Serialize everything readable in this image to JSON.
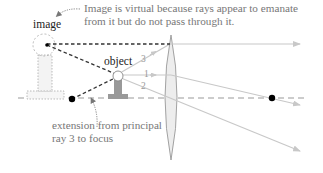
{
  "labels": {
    "image": "image",
    "object": "object",
    "note_line1": "Image is virtual because rays appear to emanate",
    "note_line2": "from it but do not pass through it.",
    "extension_line1": "extension from principal",
    "extension_line2": "ray 3 to focus",
    "ray1": "1",
    "ray2": "2",
    "ray3": "3"
  },
  "colors": {
    "ray": "#c8c8c8",
    "axis": "#999999",
    "dashed_extension": "#333333",
    "lens_fill": "#ededed",
    "lens_stroke": "#999999",
    "object_fill": "#999999",
    "image_outline": "#aaaaaa",
    "focal_point": "#000000",
    "text_note": "#777777",
    "text_label": "#222222"
  },
  "geometry": {
    "optical_axis_y": 98,
    "lens_center_x": 171,
    "lens_top_y": 35,
    "lens_bottom_y": 160,
    "focal_left": [
      72,
      99
    ],
    "focal_right": [
      272,
      98
    ],
    "object_tip": [
      118,
      75
    ],
    "image_tip": [
      47,
      45
    ]
  }
}
